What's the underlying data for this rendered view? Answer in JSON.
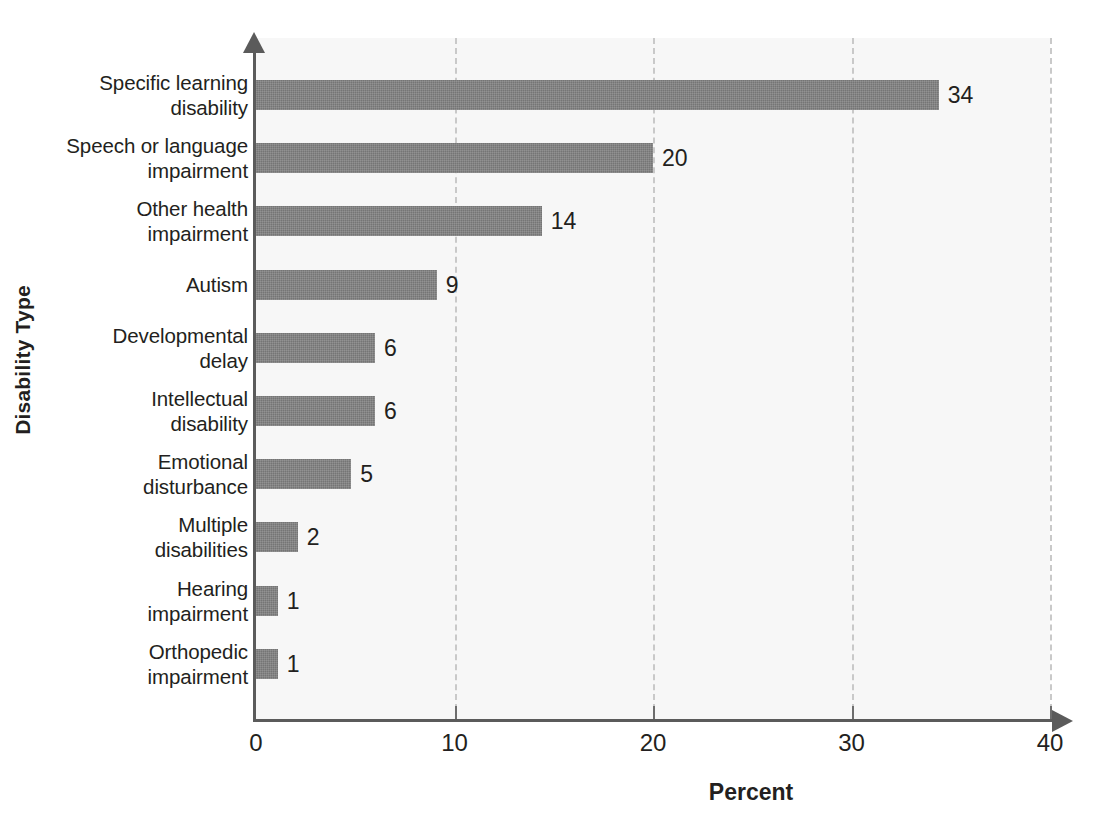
{
  "chart_data": {
    "type": "bar",
    "orientation": "horizontal",
    "title": "",
    "xlabel": "Percent",
    "ylabel": "Disability Type",
    "xlim": [
      0,
      40
    ],
    "xticks": [
      0,
      10,
      20,
      30,
      40
    ],
    "xtick_labels": [
      "0",
      "10",
      "20",
      "30",
      "40"
    ],
    "grid": "vertical-dashed",
    "legend": "none",
    "bar_color": "#757575",
    "plot_background": "#f7f7f7",
    "axis_color": "#5b5b5b",
    "categories": [
      "Specific learning disability",
      "Speech or language impairment",
      "Other health impairment",
      "Autism",
      "Developmental delay",
      "Intellectual disability",
      "Emotional disturbance",
      "Multiple disabilities",
      "Hearing impairment",
      "Orthopedic impairment"
    ],
    "category_lines": [
      [
        "Specific learning",
        "disability"
      ],
      [
        "Speech or language",
        "impairment"
      ],
      [
        "Other health",
        "impairment"
      ],
      [
        "Autism"
      ],
      [
        "Developmental",
        "delay"
      ],
      [
        "Intellectual",
        "disability"
      ],
      [
        "Emotional",
        "disturbance"
      ],
      [
        "Multiple",
        "disabilities"
      ],
      [
        "Hearing",
        "impairment"
      ],
      [
        "Orthopedic",
        "impairment"
      ]
    ],
    "values": [
      34.4,
      20.0,
      14.4,
      9.1,
      6.0,
      6.0,
      4.8,
      2.1,
      1.1,
      1.1
    ],
    "data_labels": [
      "34",
      "20",
      "14",
      "9",
      "6",
      "6",
      "5",
      "2",
      "1",
      "1"
    ]
  }
}
